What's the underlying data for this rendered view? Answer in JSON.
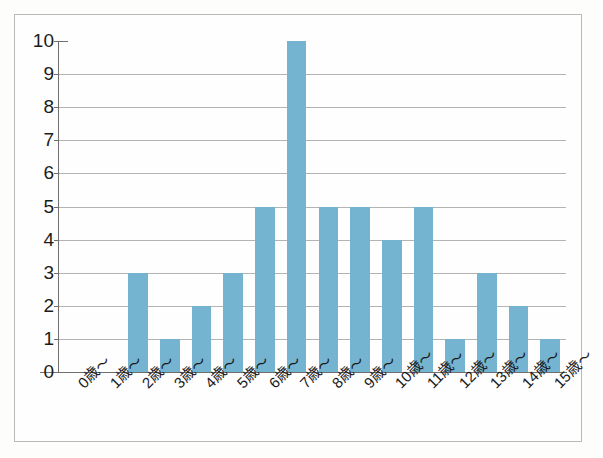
{
  "chart_data": {
    "type": "bar",
    "title": "",
    "subtitle": "",
    "xlabel": "",
    "ylabel": "",
    "categories": [
      "0歳～",
      "1歳～",
      "2歳～",
      "3歳～",
      "4歳～",
      "5歳～",
      "6歳～",
      "7歳～",
      "8歳～",
      "9歳～",
      "10歳～",
      "11歳～",
      "12歳～",
      "13歳～",
      "14歳～",
      "15歳～"
    ],
    "values": [
      0,
      0,
      3,
      1,
      2,
      3,
      5,
      10,
      5,
      5,
      4,
      5,
      1,
      3,
      2,
      1
    ],
    "ylim": [
      0,
      10
    ],
    "ytick_labels": [
      "10",
      "9",
      "8",
      "7",
      "6",
      "5",
      "4",
      "3",
      "2",
      "1",
      "0"
    ],
    "ytick_values": [
      10,
      9,
      8,
      7,
      6,
      5,
      4,
      3,
      2,
      1,
      0
    ],
    "grid": true,
    "grid_axis": "y",
    "legend": false,
    "legend_position": "none",
    "bar_color": "#74b4d0",
    "grid_color": "#9a9a9a",
    "axis_color": "#6f6f6f",
    "background_color": "#fefefe",
    "frame_color": "#b9b9b9",
    "xtick_rotation": -45
  }
}
